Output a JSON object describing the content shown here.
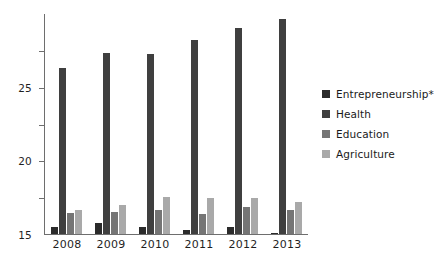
{
  "chart_data": {
    "type": "bar",
    "title": "",
    "subtitle": "",
    "xlabel": "",
    "ylabel": "",
    "categories": [
      "2008",
      "2009",
      "2010",
      "2011",
      "2012",
      "2013"
    ],
    "series": [
      {
        "name": "Entrepreneurship*",
        "color": "#2b2b2b",
        "values": [
          0.9,
          1.5,
          1.0,
          0.6,
          0.9,
          0.2
        ]
      },
      {
        "name": "Health",
        "color": "#3f3f3f",
        "values": [
          22.6,
          24.6,
          24.4,
          26.3,
          27.9,
          29.2
        ]
      },
      {
        "name": "Education",
        "color": "#757575",
        "values": [
          2.8,
          3.0,
          3.3,
          2.7,
          3.7,
          3.3
        ]
      },
      {
        "name": "Agriculture",
        "color": "#a9a9a9",
        "values": [
          3.2,
          4.0,
          5.0,
          4.85,
          4.95,
          4.4
        ]
      }
    ],
    "ylim": [
      0,
      30
    ],
    "yticks": [
      5,
      10,
      15,
      20,
      25
    ],
    "ytick_labels": [
      "5",
      "10",
      "15",
      "20",
      "25"
    ],
    "grid": false,
    "legend_position": "right",
    "axis_color": "#6e6e6e",
    "background_color": "#ffffff"
  },
  "legend": {
    "items": [
      {
        "label": "Entrepreneurship*",
        "color": "#2b2b2b"
      },
      {
        "label": "Health",
        "color": "#3f3f3f"
      },
      {
        "label": "Education",
        "color": "#757575"
      },
      {
        "label": "Agriculture",
        "color": "#a9a9a9"
      }
    ]
  }
}
